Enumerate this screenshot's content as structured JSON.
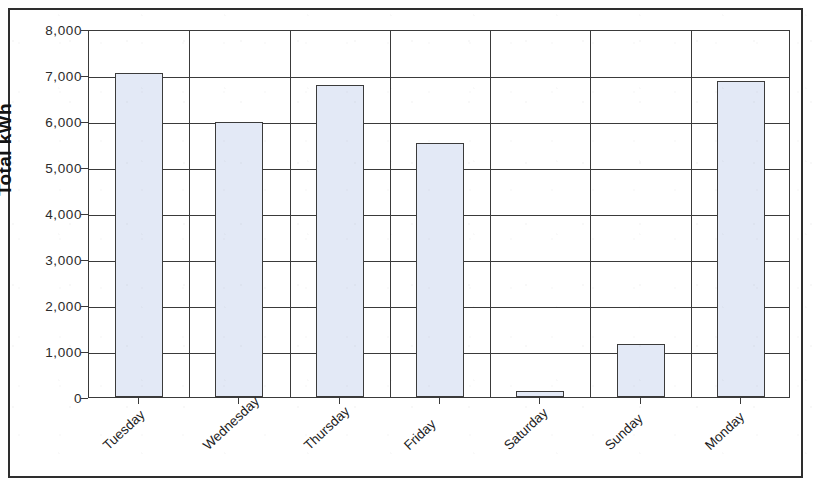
{
  "figure": {
    "frame_visible": true,
    "background_color": "#ffffff"
  },
  "chart_data": {
    "type": "bar",
    "title": "",
    "xlabel": "",
    "ylabel": "Total kWh",
    "categories": [
      "Tuesday",
      "Wednesday",
      "Thursday",
      "Friday",
      "Saturday",
      "Sunday",
      "Monday"
    ],
    "values": [
      7050,
      5970,
      6780,
      5530,
      130,
      1150,
      6860
    ],
    "series": [
      {
        "name": "Total kWh",
        "values": [
          7050,
          5970,
          6780,
          5530,
          130,
          1150,
          6860
        ]
      }
    ],
    "ylim": [
      0,
      8000
    ],
    "ytick_values": [
      0,
      1000,
      2000,
      3000,
      4000,
      5000,
      6000,
      7000,
      8000
    ],
    "ytick_labels": [
      "0",
      "1,000",
      "2,000",
      "3,000",
      "4,000",
      "5,000",
      "6,000",
      "7,000",
      "8,000"
    ],
    "grid": "horizontal",
    "legend": "none",
    "bar_fill_color": "#e3e9f6",
    "bar_edge_color": "#3b3b3b",
    "axis_color": "#3a3a3a",
    "text_color": "#1d1d1d",
    "xlabel_rotation_degrees": -43
  }
}
